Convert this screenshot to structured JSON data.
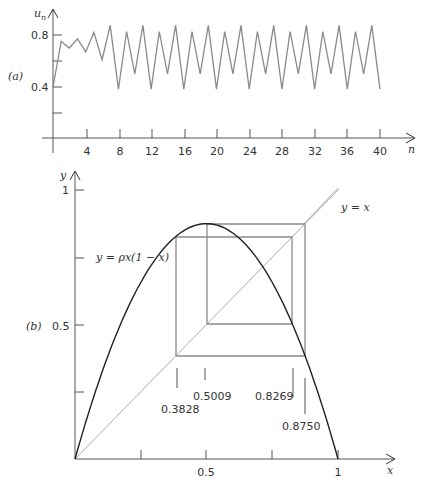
{
  "panel_labels": {
    "a": "(a)",
    "b": "(b)"
  },
  "chart_data": [
    {
      "type": "line",
      "panel": "(a)",
      "title": "",
      "xlabel": "n",
      "ylabel": "u_n",
      "xlim": [
        0,
        40
      ],
      "ylim": [
        0,
        0.9
      ],
      "xticks": [
        4,
        8,
        12,
        16,
        20,
        24,
        28,
        32,
        36,
        40
      ],
      "yticks": [
        0.2,
        0.4,
        0.6,
        0.8
      ],
      "ytick_labels": {
        "0.4": "0.4",
        "0.8": "0.8"
      },
      "grid": false,
      "series": [
        {
          "name": "u_n",
          "x": [
            0,
            1,
            2,
            3,
            4,
            5,
            6,
            7,
            8,
            9,
            10,
            11,
            12,
            13,
            14,
            15,
            16,
            17,
            18,
            19,
            20,
            21,
            22,
            23,
            24,
            25,
            26,
            27,
            28,
            29,
            30,
            31,
            32,
            33,
            34,
            35,
            36,
            37,
            38,
            39,
            40
          ],
          "values": [
            0.4,
            0.75,
            0.7,
            0.77,
            0.67,
            0.82,
            0.61,
            0.875,
            0.383,
            0.827,
            0.501,
            0.875,
            0.383,
            0.827,
            0.501,
            0.875,
            0.383,
            0.827,
            0.501,
            0.875,
            0.383,
            0.827,
            0.501,
            0.875,
            0.383,
            0.827,
            0.501,
            0.875,
            0.383,
            0.827,
            0.501,
            0.875,
            0.383,
            0.827,
            0.501,
            0.875,
            0.383,
            0.827,
            0.501,
            0.875,
            0.383
          ]
        }
      ]
    },
    {
      "type": "line",
      "panel": "(b)",
      "title": "",
      "xlabel": "x",
      "ylabel": "y",
      "xlim": [
        0,
        1
      ],
      "ylim": [
        0,
        1
      ],
      "xticks": [
        0.25,
        0.5,
        0.75,
        1
      ],
      "xtick_labels": {
        "0.5": "0.5",
        "1": "1"
      },
      "yticks": [
        0.25,
        0.5,
        0.75,
        1
      ],
      "ytick_labels": {
        "0.5": "0.5",
        "1": "1"
      },
      "grid": false,
      "series": [
        {
          "name": "y = ρx(1 − x)",
          "rho": 3.5,
          "kind": "parabola"
        },
        {
          "name": "y = x",
          "kind": "diagonal"
        },
        {
          "name": "cobweb 4-cycle",
          "kind": "cobweb",
          "cycle": [
            0.3828,
            0.8269,
            0.5009,
            0.875
          ]
        }
      ],
      "annotations": [
        "y = ρx(1 − x)",
        "y = x",
        "0.3828",
        "0.5009",
        "0.8269",
        "0.8750"
      ]
    }
  ],
  "text": {
    "a_ylabel": "u",
    "a_ylabel_sub": "n",
    "a_xlabel": "n",
    "a_yt_08": "0.8",
    "a_yt_04": "0.4",
    "a_xt": [
      "4",
      "8",
      "12",
      "16",
      "20",
      "24",
      "28",
      "32",
      "36",
      "40"
    ],
    "b_ylabel": "y",
    "b_xlabel": "x",
    "b_yt_1": "1",
    "b_yt_05": "0.5",
    "b_xt_05": "0.5",
    "b_xt_1": "1",
    "curve_label": "y = ρx(1 − x)",
    "diag_label": "y = x",
    "v1": "0.3828",
    "v2": "0.5009",
    "v3": "0.8269",
    "v4": "0.8750"
  }
}
